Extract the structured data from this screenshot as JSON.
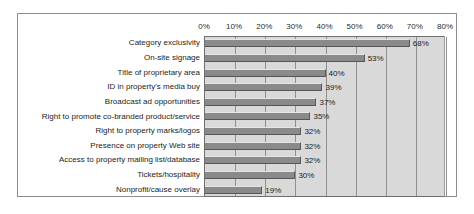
{
  "chart_data": {
    "type": "bar",
    "orientation": "horizontal",
    "title": "",
    "xlabel": "",
    "ylabel": "",
    "xlim": [
      0,
      80
    ],
    "xticks": [
      0,
      10,
      20,
      30,
      40,
      50,
      60,
      70,
      80
    ],
    "xtick_labels": [
      "0%",
      "10%",
      "20%",
      "30%",
      "40%",
      "50%",
      "60%",
      "70%",
      "80%"
    ],
    "grid": true,
    "legend": "none",
    "categories": [
      "Category exclusivity",
      "On-site signage",
      "Title of proprietary area",
      "ID in property's media buy",
      "Broadcast ad opportunities",
      "Right to promote co-branded product/service",
      "Right to property marks/logos",
      "Presence on property Web site",
      "Access to property mailing list/database",
      "Tickets/hospitality",
      "Nonprofit/cause overlay"
    ],
    "values": [
      68,
      53,
      40,
      39,
      37,
      35,
      32,
      32,
      32,
      30,
      19
    ],
    "value_labels": [
      "68%",
      "53%",
      "40%",
      "39%",
      "37%",
      "35%",
      "32%",
      "32%",
      "32%",
      "30%",
      "19%"
    ],
    "colors": {
      "bar_fill": "#8a8a8a",
      "plot_background": "#d9d9d9",
      "gridline": "#8f8f8f",
      "frame": "#8d8d8d",
      "text": "#1c1c1c",
      "figure_background": "#ffffff"
    }
  }
}
